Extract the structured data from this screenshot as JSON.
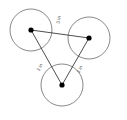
{
  "figure": {
    "type": "geometry-diagram",
    "background_color": "#ffffff",
    "circle_stroke_color": "#6b6b6b",
    "segment_stroke_color": "#3a3a3a",
    "center_dot_color": "#000000",
    "label_color": "#4a4a4a"
  },
  "circles": [
    {
      "id": "circle-top-left",
      "label": "top-left circle",
      "cx": 31,
      "cy": 30,
      "r": 21
    },
    {
      "id": "circle-top-right",
      "label": "top-right circle",
      "cx": 89,
      "cy": 38,
      "r": 21
    },
    {
      "id": "circle-bottom",
      "label": "bottom circle",
      "cx": 62,
      "cy": 85,
      "r": 21
    }
  ],
  "centers": [
    {
      "id": "center-top-left",
      "cx": 31,
      "cy": 30,
      "r": 2.6
    },
    {
      "id": "center-top-right",
      "cx": 89,
      "cy": 38,
      "r": 2.6
    },
    {
      "id": "center-bottom",
      "cx": 62,
      "cy": 85,
      "r": 2.6
    }
  ],
  "segments": [
    {
      "id": "segment-top",
      "from": "center-top-left",
      "to": "center-top-right",
      "x1": 31,
      "y1": 30,
      "x2": 89,
      "y2": 38,
      "length_label": "3 in",
      "label_x": 60,
      "label_y": 20,
      "label_rotation": -82
    },
    {
      "id": "segment-left",
      "from": "center-top-left",
      "to": "center-bottom",
      "x1": 31,
      "y1": 30,
      "x2": 62,
      "y2": 85,
      "length_label": "3 in",
      "label_x": 41,
      "label_y": 68,
      "label_rotation": -62
    },
    {
      "id": "segment-right",
      "from": "center-top-right",
      "to": "center-bottom",
      "x1": 89,
      "y1": 38,
      "x2": 62,
      "y2": 85,
      "length_label": "3 in",
      "label_x": 81,
      "label_y": 70,
      "label_rotation": -62
    }
  ],
  "labels": {
    "top_side": "3 in",
    "left_side": "3 in",
    "right_side": "3 in"
  }
}
